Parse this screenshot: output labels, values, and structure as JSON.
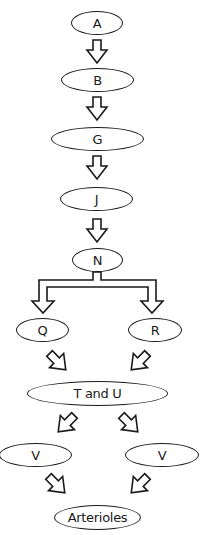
{
  "diagram": {
    "type": "flowchart",
    "nodes": [
      {
        "id": "A",
        "label": "A"
      },
      {
        "id": "B",
        "label": "B"
      },
      {
        "id": "G",
        "label": "G"
      },
      {
        "id": "J",
        "label": "J"
      },
      {
        "id": "N",
        "label": "N"
      },
      {
        "id": "Q",
        "label": "Q"
      },
      {
        "id": "R",
        "label": "R"
      },
      {
        "id": "TU",
        "label": "T and U"
      },
      {
        "id": "V1",
        "label": "V"
      },
      {
        "id": "V2",
        "label": "V"
      },
      {
        "id": "Art",
        "label": "Arterioles"
      }
    ],
    "edges": [
      {
        "from": "A",
        "to": "B"
      },
      {
        "from": "B",
        "to": "G"
      },
      {
        "from": "G",
        "to": "J"
      },
      {
        "from": "J",
        "to": "N"
      },
      {
        "from": "N",
        "to": "Q"
      },
      {
        "from": "N",
        "to": "R"
      },
      {
        "from": "Q",
        "to": "TU"
      },
      {
        "from": "R",
        "to": "TU"
      },
      {
        "from": "TU",
        "to": "V1"
      },
      {
        "from": "TU",
        "to": "V2"
      },
      {
        "from": "V1",
        "to": "Art"
      },
      {
        "from": "V2",
        "to": "Art"
      }
    ],
    "colors": {
      "stroke": "#1a1a1a",
      "fill": "#ffffff"
    }
  }
}
